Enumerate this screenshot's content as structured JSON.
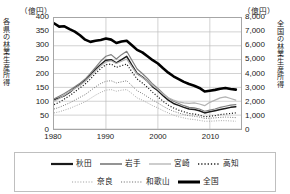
{
  "chart_data": {
    "type": "line",
    "title": "",
    "xlabel": "",
    "grid": true,
    "legend_position": "bottom",
    "left_axis": {
      "unit": "（億円）",
      "title": "各県の林業生産所得",
      "ticks": [
        "400",
        "350",
        "300",
        "250",
        "200",
        "150",
        "100",
        "50",
        "0"
      ],
      "ylim": [
        0,
        400
      ]
    },
    "right_axis": {
      "unit": "（億円）",
      "title": "全国の林業生産所得",
      "ticks": [
        "8,000",
        "7,000",
        "6,000",
        "5,000",
        "4,000",
        "3,000",
        "2,000",
        "1,000",
        "0"
      ],
      "ylim": [
        0,
        8000
      ]
    },
    "x": [
      1980,
      1981,
      1982,
      1983,
      1984,
      1985,
      1986,
      1987,
      1988,
      1989,
      1990,
      1991,
      1992,
      1993,
      1994,
      1995,
      1996,
      1997,
      1998,
      1999,
      2000,
      2001,
      2002,
      2003,
      2004,
      2005,
      2006,
      2007,
      2008,
      2009,
      2010,
      2011,
      2012,
      2013,
      2014,
      2015
    ],
    "xticks": [
      "1980",
      "1990",
      "2000",
      "2010"
    ],
    "xtick_values": [
      1980,
      1990,
      2000,
      2010
    ],
    "xlim": [
      1980,
      2016
    ],
    "series": [
      {
        "name": "秋田",
        "axis": "left",
        "style": "solid",
        "color": "#1a1a1a",
        "width": 1.5,
        "values": [
          105,
          112,
          120,
          132,
          148,
          160,
          175,
          195,
          215,
          232,
          248,
          250,
          238,
          250,
          262,
          230,
          200,
          188,
          172,
          152,
          138,
          120,
          104,
          92,
          85,
          78,
          72,
          70,
          66,
          58,
          62,
          66,
          70,
          74,
          78,
          80
        ]
      },
      {
        "name": "岩手",
        "axis": "left",
        "style": "solid",
        "color": "#808080",
        "width": 1.2,
        "values": [
          108,
          118,
          128,
          140,
          152,
          165,
          180,
          200,
          222,
          245,
          262,
          268,
          252,
          268,
          280,
          248,
          216,
          200,
          182,
          162,
          146,
          128,
          112,
          100,
          92,
          84,
          78,
          76,
          72,
          64,
          68,
          72,
          78,
          82,
          86,
          88
        ]
      },
      {
        "name": "宮崎",
        "axis": "left",
        "style": "solid",
        "color": "#b3b3b3",
        "width": 1.2,
        "values": [
          100,
          110,
          122,
          134,
          146,
          158,
          172,
          190,
          210,
          228,
          242,
          246,
          236,
          244,
          252,
          224,
          198,
          186,
          172,
          156,
          142,
          126,
          112,
          104,
          98,
          94,
          92,
          94,
          90,
          84,
          96,
          104,
          112,
          116,
          110,
          104
        ]
      },
      {
        "name": "高知",
        "axis": "left",
        "style": "dotted",
        "color": "#1a1a1a",
        "width": 1.2,
        "values": [
          88,
          96,
          108,
          120,
          134,
          148,
          162,
          180,
          200,
          218,
          232,
          234,
          222,
          228,
          234,
          206,
          180,
          166,
          150,
          132,
          116,
          100,
          86,
          76,
          68,
          62,
          56,
          54,
          50,
          44,
          46,
          48,
          52,
          54,
          56,
          58
        ]
      },
      {
        "name": "奈良",
        "axis": "left",
        "style": "dotted",
        "color": "#a0a0a0",
        "width": 1.0,
        "values": [
          58,
          62,
          68,
          74,
          82,
          90,
          98,
          110,
          122,
          132,
          140,
          142,
          136,
          140,
          142,
          128,
          112,
          104,
          94,
          84,
          76,
          66,
          58,
          50,
          44,
          40,
          36,
          34,
          31,
          28,
          28,
          29,
          30,
          30,
          29,
          28
        ]
      },
      {
        "name": "和歌山",
        "axis": "left",
        "style": "dotted",
        "color": "#6e6e6e",
        "width": 1.0,
        "values": [
          72,
          78,
          86,
          94,
          104,
          114,
          124,
          138,
          152,
          164,
          172,
          174,
          166,
          170,
          174,
          156,
          138,
          128,
          116,
          104,
          94,
          82,
          72,
          64,
          58,
          52,
          48,
          46,
          43,
          38,
          39,
          40,
          42,
          43,
          42,
          41
        ]
      },
      {
        "name": "全国",
        "axis": "right",
        "style": "solid",
        "color": "#000000",
        "width": 2.6,
        "values": [
          7620,
          7380,
          7400,
          7200,
          7020,
          6760,
          6440,
          6280,
          6360,
          6420,
          6520,
          6440,
          6200,
          6300,
          6360,
          6040,
          5700,
          5520,
          5240,
          4960,
          4720,
          4380,
          4060,
          3800,
          3600,
          3400,
          3240,
          3120,
          2960,
          2700,
          2760,
          2820,
          2900,
          2960,
          2880,
          2840
        ]
      }
    ]
  },
  "legend": {
    "rows": [
      [
        {
          "label": "秋田",
          "style": "solid",
          "color": "#1a1a1a",
          "width": 2.2
        },
        {
          "label": "岩手",
          "style": "solid",
          "color": "#7a7a7a",
          "width": 1.6
        },
        {
          "label": "宮崎",
          "style": "solid",
          "color": "#b8b8b8",
          "width": 1.4
        },
        {
          "label": "高知",
          "style": "dotted",
          "color": "#1a1a1a",
          "width": 1.4
        }
      ],
      [
        {
          "label": "奈良",
          "style": "dotted",
          "color": "#a0a0a0",
          "width": 1.2
        },
        {
          "label": "和歌山",
          "style": "dotted",
          "color": "#6e6e6e",
          "width": 1.2
        },
        {
          "label": "全国",
          "style": "solid",
          "color": "#000000",
          "width": 3.0
        }
      ]
    ]
  }
}
